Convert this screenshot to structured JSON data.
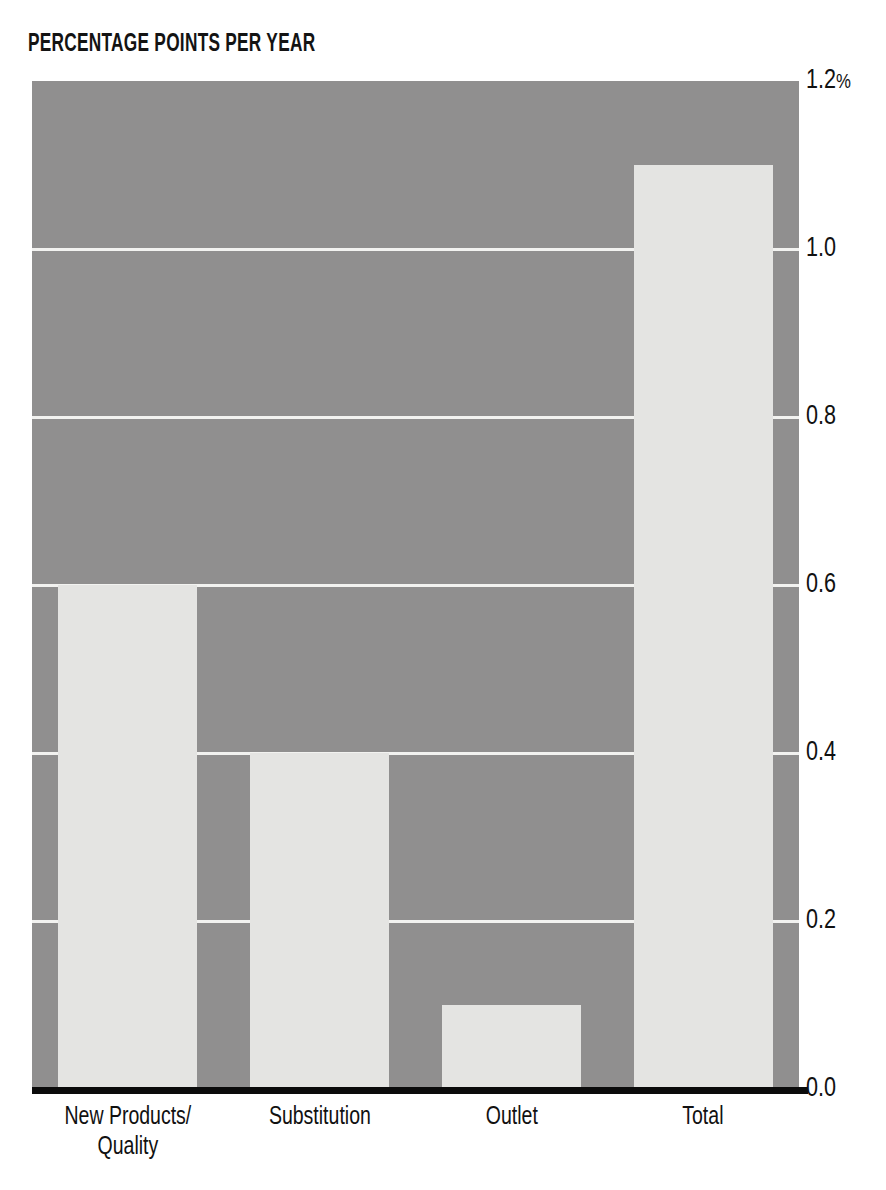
{
  "header": {
    "clipped_title": "",
    "units_label": "PERCENTAGE POINTS PER YEAR"
  },
  "colors": {
    "plot_background": "#908F8F",
    "bar_fill": "#E4E4E2",
    "gridline": "#F2F2F0",
    "axis_line": "#0B0B0B",
    "text": "#111111",
    "page_background": "#FFFFFF"
  },
  "axis": {
    "y_ticks": [
      {
        "value": 1.2,
        "label": "1.2",
        "suffix": "%"
      },
      {
        "value": 1.0,
        "label": "1.0",
        "suffix": ""
      },
      {
        "value": 0.8,
        "label": "0.8",
        "suffix": ""
      },
      {
        "value": 0.6,
        "label": "0.6",
        "suffix": ""
      },
      {
        "value": 0.4,
        "label": "0.4",
        "suffix": ""
      },
      {
        "value": 0.2,
        "label": "0.2",
        "suffix": ""
      },
      {
        "value": 0.0,
        "label": "0.0",
        "suffix": ""
      }
    ],
    "gridline_values": [
      1.0,
      0.8,
      0.6,
      0.4,
      0.2
    ]
  },
  "chart_data": {
    "type": "bar",
    "title": "",
    "subtitle": "",
    "xlabel": "",
    "ylabel": "PERCENTAGE POINTS PER YEAR",
    "ylim": [
      0.0,
      1.2
    ],
    "ytick_labels": [
      "0.0",
      "0.2",
      "0.4",
      "0.6",
      "0.8",
      "1.0",
      "1.2%"
    ],
    "grid": true,
    "legend": "none",
    "categories": [
      "New Products/ Quality",
      "Substitution",
      "Outlet",
      "Total"
    ],
    "category_lines": [
      [
        "New Products/",
        "Quality"
      ],
      [
        "Substitution"
      ],
      [
        "Outlet"
      ],
      [
        "Total"
      ]
    ],
    "values": [
      0.6,
      0.4,
      0.1,
      1.1
    ],
    "value_unit": "percentage points per year"
  }
}
